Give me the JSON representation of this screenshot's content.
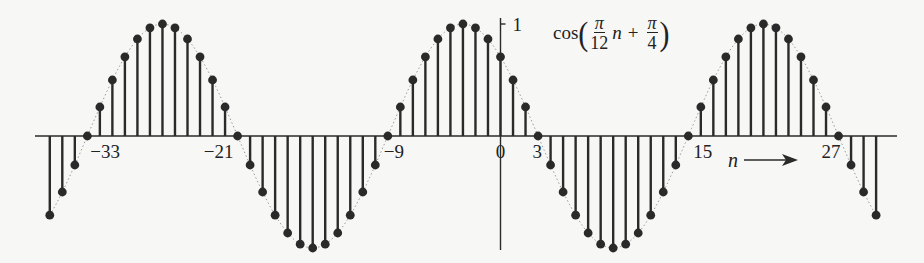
{
  "chart_data": {
    "type": "stem",
    "title": "",
    "function_label": {
      "prefix": "cos",
      "frac1_num": "π",
      "frac1_den": "12",
      "var": "n",
      "plus": "+",
      "frac2_num": "π",
      "frac2_den": "4",
      "text": "cos(π/12 n + π/4)"
    },
    "xlabel": "n",
    "ylabel": "",
    "y_tick_label": "1",
    "x_tick_labels": [
      {
        "n": -33,
        "label": "−33"
      },
      {
        "n": -21,
        "label": "−21"
      },
      {
        "n": -9,
        "label": "−9"
      },
      {
        "n": 0,
        "label": "0"
      },
      {
        "n": 3,
        "label": "3"
      },
      {
        "n": 15,
        "label": "15"
      },
      {
        "n": 27,
        "label": "27"
      }
    ],
    "n_range": [
      -36,
      30
    ],
    "ylim": [
      -1,
      1
    ],
    "omega": 0.2617993877991494,
    "phase": 0.7853981633974483,
    "zero_crossings": [
      -33,
      -21,
      -9,
      3,
      15,
      27
    ],
    "envelope": "dotted gray continuous cosine",
    "grid": false,
    "colors": {
      "stem": "#2a2a2a",
      "envelope": "#9a9a9a",
      "axis": "#2a2a2a"
    }
  },
  "layout": {
    "x0": 500.5,
    "dx": 12.52,
    "baseline_y": 136,
    "amp": 112,
    "axis_x_start": 35,
    "axis_x_end": 897,
    "yaxis_top": 18,
    "yaxis_bottom": 250
  }
}
